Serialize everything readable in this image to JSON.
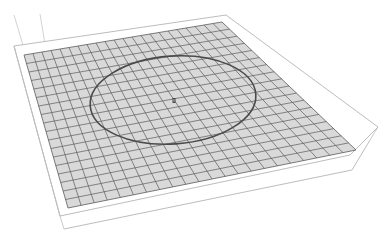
{
  "viewport": {
    "name": "3d-sketch-viewport",
    "background": "#ffffff"
  },
  "plate": {
    "fill": "#d9d9d9",
    "grid_line_color": "#5a5a5a",
    "grid_divisions_u": 22,
    "grid_divisions_v": 18,
    "corners": {
      "top_left": [
        24,
        55
      ],
      "top_right": [
        222,
        22
      ],
      "bottom_right": [
        356,
        150
      ],
      "bottom_left": [
        68,
        208
      ]
    }
  },
  "frame": {
    "stroke": "#bdbdbd",
    "outer_top": [
      [
        14,
        46
      ],
      [
        226,
        15
      ],
      [
        378,
        127
      ]
    ],
    "outer_bottom": [
      [
        60,
        216
      ],
      [
        350,
        155
      ],
      [
        378,
        127
      ]
    ],
    "lower_lip": [
      [
        64,
        229
      ],
      [
        352,
        170
      ],
      [
        370,
        140
      ]
    ]
  },
  "construction_lines": {
    "stroke": "#c8c8c8",
    "lines": [
      [
        [
          14,
          15
        ],
        [
          28,
          62
        ]
      ],
      [
        [
          40,
          14
        ],
        [
          48,
          62
        ]
      ]
    ]
  },
  "sketch": {
    "circle": {
      "cx": 173,
      "cy": 100,
      "rx": 83,
      "ry": 44,
      "rotate": -4,
      "stroke": "#4a4a4a"
    },
    "origin_marker": {
      "x": 174,
      "y": 101,
      "color": "#444444"
    }
  }
}
